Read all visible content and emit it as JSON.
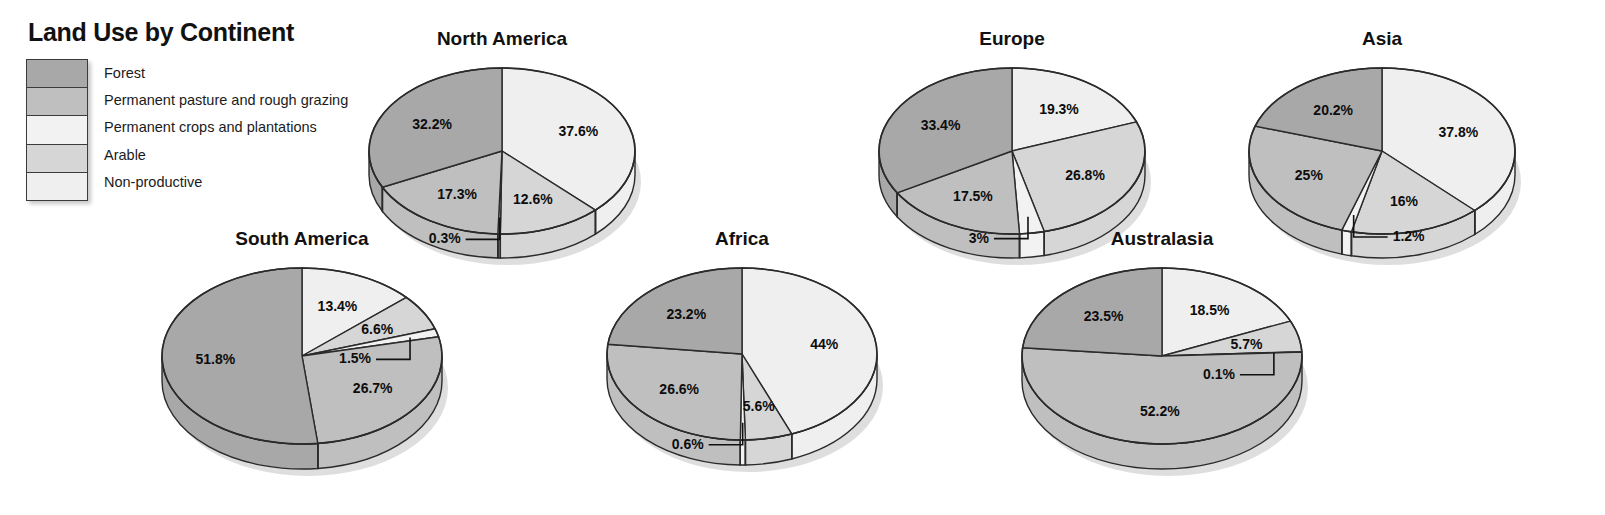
{
  "legend": {
    "title": "Land Use by Continent",
    "items": [
      {
        "label": "Forest",
        "color": "#a8a8a8"
      },
      {
        "label": "Permanent pasture and rough grazing",
        "color": "#bfbfbf"
      },
      {
        "label": "Permanent crops and plantations",
        "color": "#f2f2f2"
      },
      {
        "label": "Arable",
        "color": "#d6d6d6"
      },
      {
        "label": "Non-productive",
        "color": "#efefef"
      }
    ]
  },
  "chart_data": {
    "type": "pie",
    "title": "Land Use by Continent",
    "unit": "%",
    "categories": [
      "Forest",
      "Permanent pasture and rough grazing",
      "Permanent crops and plantations",
      "Arable",
      "Non-productive"
    ],
    "colors": [
      "#a8a8a8",
      "#bfbfbf",
      "#f2f2f2",
      "#d6d6d6",
      "#efefef"
    ],
    "legend_position": "top-left",
    "slice_order_clockwise_from_12": [
      "Non-productive",
      "Arable",
      "Permanent crops and plantations",
      "Permanent pasture and rough grazing",
      "Forest"
    ],
    "charts": [
      {
        "name": "North America",
        "values": {
          "Forest": 32.2,
          "Permanent pasture and rough grazing": 17.3,
          "Permanent crops and plantations": 0.3,
          "Arable": 12.6,
          "Non-productive": 37.6
        },
        "labels": [
          "37.6%",
          "12.6%",
          "0.3%",
          "17.3%",
          "32.2%"
        ]
      },
      {
        "name": "Europe",
        "values": {
          "Forest": 33.4,
          "Permanent pasture and rough grazing": 17.5,
          "Permanent crops and plantations": 3,
          "Arable": 26.8,
          "Non-productive": 19.3
        },
        "labels": [
          "19.3%",
          "26.8%",
          "3%",
          "17.5%",
          "33.4%"
        ]
      },
      {
        "name": "Asia",
        "values": {
          "Forest": 20.2,
          "Permanent pasture and rough grazing": 25,
          "Permanent crops and plantations": 1.2,
          "Arable": 16,
          "Non-productive": 37.8
        },
        "labels": [
          "37.8%",
          "16%",
          "1.2%",
          "25%",
          "20.2%"
        ]
      },
      {
        "name": "South America",
        "values": {
          "Forest": 51.8,
          "Permanent pasture and rough grazing": 26.7,
          "Permanent crops and plantations": 1.5,
          "Arable": 6.6,
          "Non-productive": 13.4
        },
        "labels": [
          "13.4%",
          "6.6%",
          "1.5%",
          "26.7%",
          "51.8%"
        ]
      },
      {
        "name": "Africa",
        "values": {
          "Forest": 23.2,
          "Permanent pasture and rough grazing": 26.6,
          "Permanent crops and plantations": 0.6,
          "Arable": 5.6,
          "Non-productive": 44
        },
        "labels": [
          "44%",
          "5.6%",
          "0.6%",
          "26.6%",
          "23.2%"
        ]
      },
      {
        "name": "Australasia",
        "values": {
          "Forest": 23.5,
          "Permanent pasture and rough grazing": 52.2,
          "Permanent crops and plantations": 0.1,
          "Arable": 5.7,
          "Non-productive": 18.5
        },
        "labels": [
          "18.5%",
          "5.7%",
          "0.1%",
          "52.2%",
          "23.5%"
        ]
      }
    ]
  },
  "layout": {
    "pies": [
      {
        "key": "North America",
        "left": 352,
        "top": 28,
        "w": 300,
        "h": 240,
        "rx": 133,
        "ry": 83,
        "depth": 24
      },
      {
        "key": "Europe",
        "left": 862,
        "top": 28,
        "w": 300,
        "h": 240,
        "rx": 133,
        "ry": 83,
        "depth": 24
      },
      {
        "key": "Asia",
        "left": 1232,
        "top": 28,
        "w": 300,
        "h": 240,
        "rx": 133,
        "ry": 83,
        "depth": 24
      },
      {
        "key": "South America",
        "left": 152,
        "top": 228,
        "w": 300,
        "h": 250,
        "rx": 140,
        "ry": 88,
        "depth": 25
      },
      {
        "key": "Africa",
        "left": 592,
        "top": 228,
        "w": 300,
        "h": 250,
        "rx": 135,
        "ry": 86,
        "depth": 25
      },
      {
        "key": "Australasia",
        "left": 1012,
        "top": 228,
        "w": 300,
        "h": 250,
        "rx": 140,
        "ry": 88,
        "depth": 25
      }
    ]
  }
}
